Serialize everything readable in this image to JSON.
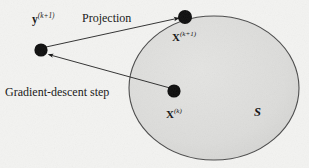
{
  "figure": {
    "background_color": "#f3f3f1",
    "region": {
      "name": "S",
      "label": "S",
      "fill_color": "#dcdcdc",
      "stroke_color": "#3a3a3a",
      "shape": "ellipse",
      "center_x": 214,
      "center_y": 88,
      "radius_x": 85,
      "radius_y": 72
    },
    "points": [
      {
        "id": "y-next",
        "label_text": "y",
        "label_superscript": "(k+1)",
        "x": 41,
        "y": 50,
        "radius": 6.5,
        "color": "#0d0d0d",
        "inside_region": false
      },
      {
        "id": "x-next",
        "label_text": "X",
        "label_superscript": "(k+1)",
        "x": 185,
        "y": 17,
        "radius": 7,
        "color": "#0d0d0d",
        "inside_region": false
      },
      {
        "id": "x-current",
        "label_text": "X",
        "label_superscript": "(k)",
        "x": 174,
        "y": 91,
        "radius": 6.5,
        "color": "#0d0d0d",
        "inside_region": true
      }
    ],
    "arrows": [
      {
        "id": "gradient-descent-arrow",
        "label": "Gradient-descent step",
        "from": "x-current",
        "to": "y-next",
        "x1": 170,
        "y1": 88,
        "x2": 47,
        "y2": 54
      },
      {
        "id": "projection-arrow",
        "label": "Projection",
        "from": "y-next",
        "to": "x-next",
        "x1": 46,
        "y1": 47,
        "x2": 178,
        "y2": 18
      }
    ],
    "labels": {
      "y_next": {
        "base": "y",
        "sup": "(k+1)"
      },
      "projection": "Projection",
      "x_next": {
        "base": "X",
        "sup": "(k+1)"
      },
      "gradient_descent": "Gradient-descent step",
      "x_current": {
        "base": "X",
        "sup": "(k)"
      },
      "region": "S"
    }
  }
}
